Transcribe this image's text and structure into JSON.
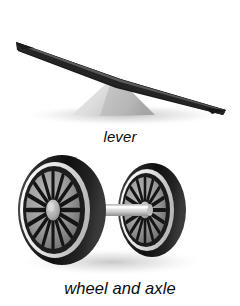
{
  "figure": {
    "background_color": "#ffffff",
    "width": 240,
    "height": 306,
    "items": [
      {
        "id": "lever",
        "caption": "lever",
        "icon_name": "lever-illustration",
        "parts": [
          {
            "name": "lever-plank",
            "color": "#2b2b2b"
          },
          {
            "name": "lever-fulcrum",
            "color": "#c9c9c9"
          }
        ]
      },
      {
        "id": "wheel-and-axle",
        "caption": "wheel and axle",
        "icon_name": "wheel-and-axle-illustration",
        "parts": [
          {
            "name": "wheel-left",
            "color": "#1c1c1c"
          },
          {
            "name": "wheel-right",
            "color": "#1c1c1c"
          },
          {
            "name": "axle-shaft",
            "color": "#d8d8d8"
          },
          {
            "name": "wheel-hub",
            "color": "#b4b4b4"
          }
        ],
        "spoke_count": 16
      }
    ]
  },
  "colors": {
    "plank_dark": "#232323",
    "plank_mid": "#3a3a3a",
    "plank_edge": "#111111",
    "fulcrum_light": "#e2e2e2",
    "fulcrum_mid": "#cdcdcd",
    "fulcrum_dark": "#b0b0b0",
    "tire_dark": "#161616",
    "tire_mid": "#4a4a4a",
    "rim_light": "#f2f2f2",
    "spoke_bg": "#8e8e8e",
    "spoke_dark": "#1a1a1a",
    "hub_light": "#c2c2c2",
    "axle_light": "#ececec",
    "axle_shade": "#9a9a9a",
    "shadow": "#bdbdbd",
    "text": "#0b0b0b"
  }
}
